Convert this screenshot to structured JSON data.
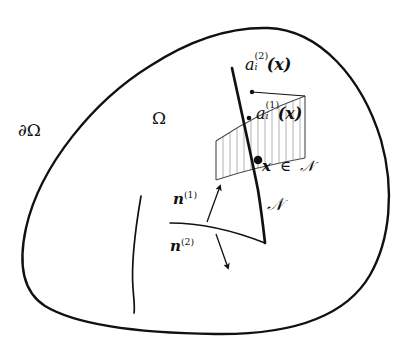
{
  "figure": {
    "background_color": "#ffffff",
    "stroke_color": "#111111",
    "hatch_color": "#9a9a9a",
    "width": 404,
    "height": 356
  },
  "labels": {
    "boundary": {
      "name": "boundary-label",
      "text_partial": "∂Ω",
      "symbol": "∂",
      "omega": "Ω"
    },
    "domain": {
      "name": "domain-label",
      "text": "Ω"
    },
    "interface": {
      "name": "interface-label",
      "text": "𝒩"
    },
    "point_on_interface": {
      "name": "point-membership-label",
      "variable": "x",
      "relation": "∈",
      "set": "𝒩"
    },
    "tangent_upper": {
      "name": "tangent-a2-label",
      "base": "a",
      "subscript": "i",
      "superscript": "(2)",
      "argument": "(x)"
    },
    "tangent_lower": {
      "name": "tangent-a1-label",
      "base": "a",
      "subscript": "i",
      "superscript": "(1)",
      "argument": "(x)"
    },
    "normal_upper": {
      "name": "normal-n1-label",
      "base": "n",
      "superscript": "(1)"
    },
    "normal_lower": {
      "name": "normal-n2-label",
      "base": "n",
      "superscript": "(2)"
    }
  },
  "geometry": {
    "outer_blob": {
      "name": "domain-boundary-curve",
      "path": "M 268 28 C 320 30 362 78 381 140 C 395 190 390 240 370 275 C 345 318 290 335 215 334 C 140 333 78 326 45 306 C 20 290 19 260 26 228 C 40 165 95 100 150 66 C 190 40 230 27 268 28 Z",
      "stroke_width": 2.4
    },
    "inner_arc": {
      "name": "inner-crack-curve",
      "path": "M 141 196 C 136 225 131 262 133 288 C 134 302 135 308 134 313",
      "stroke_width": 1.6
    },
    "interface_curve": {
      "name": "interface-N-curve",
      "path": "M 232 68 C 240 105 250 150 258 190 C 262 215 264 234 265 243",
      "stroke_width": 2.6
    },
    "surface_curve": {
      "name": "material-surface-curve",
      "path": "M 170 223 C 200 223 232 230 265 243",
      "stroke_width": 1.5
    },
    "hatch_patch": {
      "name": "tangent-plane-patch",
      "top_edge": "M 216 141 C 240 125 272 108 305 96",
      "bottom_edge": "M 216 180 C 240 172 272 164 305 158",
      "left_edge": "M 216 141 L 216 180",
      "right_edge": "M 305 96 L 305 158",
      "hatch_count": 13
    },
    "marker_point": {
      "name": "point-x-marker",
      "cx": 258,
      "cy": 160,
      "r": 4.2
    },
    "tangent_dot_a1": {
      "name": "tangent-a1-dot",
      "cx": 249,
      "cy": 118,
      "r": 2.2
    },
    "tangent_dot_a2": {
      "name": "tangent-a2-dot",
      "cx": 252,
      "cy": 92,
      "r": 2.2
    },
    "tangent_line_a2": {
      "name": "tangent-a2-line",
      "path": "M 252 92 L 305 96"
    },
    "arrow_n1": {
      "name": "normal-n1-arrow",
      "path": "M 207 222 L 219 190"
    },
    "arrow_n2": {
      "name": "normal-n2-arrow",
      "path": "M 216 233 L 227 264"
    }
  }
}
